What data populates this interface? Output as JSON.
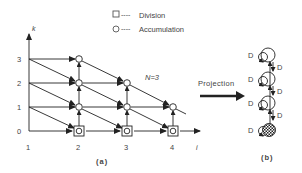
{
  "legend": {
    "division_label": "Division",
    "accumulation_label": "Accumulation",
    "dashes": "----"
  },
  "panel_a": {
    "caption": "(a)",
    "axis_k_label": "k",
    "axis_i_label": "i",
    "k_ticks": [
      "3",
      "2",
      "1",
      "0"
    ],
    "i_ticks": [
      "1",
      "2",
      "3",
      "4"
    ],
    "annotation": "N=3"
  },
  "projection": {
    "label": "Projection"
  },
  "panel_b": {
    "caption": "(b)",
    "delay_label": "D",
    "nodes": [
      {
        "type": "accumulation"
      },
      {
        "type": "accumulation"
      },
      {
        "type": "accumulation"
      },
      {
        "type": "division"
      }
    ]
  }
}
